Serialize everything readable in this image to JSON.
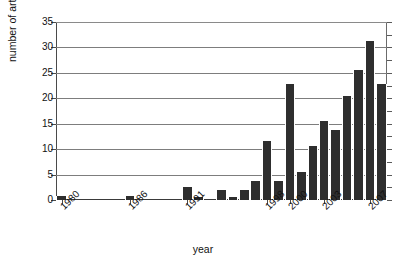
{
  "chart_data": {
    "type": "bar",
    "title": "",
    "xlabel": "year",
    "ylabel": "number of articles",
    "ylim": [
      0,
      35
    ],
    "yticks": [
      0,
      5,
      10,
      15,
      20,
      25,
      30,
      35
    ],
    "grid": true,
    "legend": null,
    "bar_color": "#2e2e2e",
    "categories": [
      "1980",
      "1981",
      "1982",
      "1983",
      "1984",
      "1985",
      "1986",
      "1987",
      "1988",
      "1989",
      "1990",
      "1991",
      "1992",
      "1993",
      "1994",
      "1995",
      "1996",
      "1997",
      "1998",
      "1999",
      "2000",
      "2001",
      "2002",
      "2003",
      "2004",
      "2005",
      "2006",
      "2007",
      "2008"
    ],
    "labeled_xticks": [
      "1980",
      "1986",
      "1991",
      "1998",
      "2000",
      "2003",
      "2007"
    ],
    "values": [
      0.8,
      0,
      0,
      0,
      0,
      0,
      0.8,
      0,
      0,
      0,
      0,
      2.5,
      0.6,
      0,
      1.9,
      0.6,
      1.9,
      3.8,
      11.7,
      3.8,
      22.8,
      5.6,
      10.6,
      15.6,
      13.8,
      20.5,
      25.5,
      31.2,
      22.8
    ]
  },
  "axes": {
    "y_title": "number of articles",
    "x_title": "year"
  }
}
